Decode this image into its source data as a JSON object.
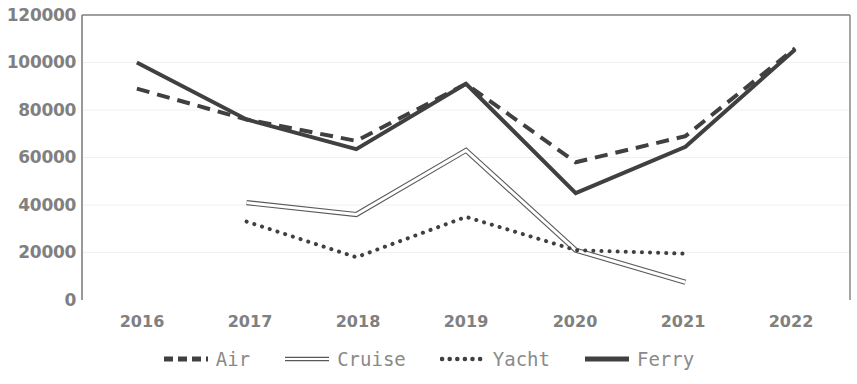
{
  "chart_data": {
    "type": "line",
    "title": "",
    "xlabel": "",
    "ylabel": "",
    "x": [
      "2016",
      "2017",
      "2018",
      "2019",
      "2020",
      "2021",
      "2022"
    ],
    "categories": [
      "2016",
      "2017",
      "2018",
      "2019",
      "2020",
      "2021",
      "2022"
    ],
    "ylim": [
      0,
      120000
    ],
    "yticks": [
      0,
      20000,
      40000,
      60000,
      80000,
      100000,
      120000
    ],
    "ytick_labels": [
      "0",
      "20000",
      "40000",
      "60000",
      "80000",
      "100000",
      "120000"
    ],
    "grid": true,
    "grid_axis": "y",
    "legend_position": "bottom",
    "series": [
      {
        "name": "Air",
        "style": "dashed",
        "color": "#404040",
        "width": 4,
        "values": [
          89000,
          76000,
          67000,
          91000,
          58000,
          69000,
          106000
        ]
      },
      {
        "name": "Cruise",
        "style": "solid-thin",
        "color": "#595959",
        "width": 1.5,
        "values": [
          null,
          41000,
          36000,
          63000,
          21000,
          7500,
          null
        ]
      },
      {
        "name": "Yacht",
        "style": "dotted",
        "color": "#404040",
        "width": 4,
        "values": [
          null,
          33000,
          18000,
          35000,
          21000,
          19500,
          null
        ]
      },
      {
        "name": "Ferry",
        "style": "solid",
        "color": "#404040",
        "width": 4,
        "values": [
          100000,
          76000,
          63500,
          91000,
          45000,
          64500,
          105500
        ]
      }
    ]
  },
  "axes": {
    "y_tick_labels": [
      "120000",
      "100000",
      "80000",
      "60000",
      "40000",
      "20000",
      "0"
    ],
    "x_tick_labels": [
      "2016",
      "2017",
      "2018",
      "2019",
      "2020",
      "2021",
      "2022"
    ]
  },
  "legend": {
    "items": [
      {
        "label": "Air",
        "icon": "dashed-line-icon"
      },
      {
        "label": "Cruise",
        "icon": "thin-line-icon"
      },
      {
        "label": "Yacht",
        "icon": "dotted-line-icon"
      },
      {
        "label": "Ferry",
        "icon": "solid-line-icon"
      }
    ]
  },
  "colors": {
    "plot_border": "#7f7f7f",
    "gridline": "#f0f0f0",
    "tick_text": "#808080",
    "series_dark": "#404040",
    "series_thin": "#595959"
  }
}
